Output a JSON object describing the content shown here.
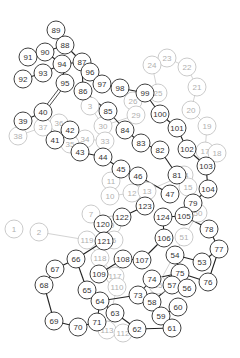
{
  "diagram": {
    "type": "node-chain-graph",
    "node_radius": 9,
    "colors": {
      "dark_stroke": "#2a2a2a",
      "faint_stroke": "#bdbdbd",
      "dark_text": "#333333",
      "faint_text": "#b0b0b0",
      "background": "#ffffff"
    },
    "dark_nodes": [
      {
        "id": "89",
        "x": 56,
        "y": 30
      },
      {
        "id": "88",
        "x": 65,
        "y": 45
      },
      {
        "id": "90",
        "x": 45,
        "y": 52
      },
      {
        "id": "91",
        "x": 28,
        "y": 57
      },
      {
        "id": "87",
        "x": 82,
        "y": 62
      },
      {
        "id": "94",
        "x": 62,
        "y": 64
      },
      {
        "id": "93",
        "x": 43,
        "y": 73
      },
      {
        "id": "96",
        "x": 90,
        "y": 72
      },
      {
        "id": "92",
        "x": 23,
        "y": 79
      },
      {
        "id": "97",
        "x": 102,
        "y": 84
      },
      {
        "id": "95",
        "x": 65,
        "y": 83
      },
      {
        "id": "98",
        "x": 120,
        "y": 88
      },
      {
        "id": "86",
        "x": 83,
        "y": 91
      },
      {
        "id": "99",
        "x": 145,
        "y": 93
      },
      {
        "id": "40",
        "x": 43,
        "y": 112
      },
      {
        "id": "85",
        "x": 108,
        "y": 111
      },
      {
        "id": "100",
        "x": 160,
        "y": 114
      },
      {
        "id": "39",
        "x": 23,
        "y": 121
      },
      {
        "id": "42",
        "x": 70,
        "y": 130
      },
      {
        "id": "84",
        "x": 125,
        "y": 130
      },
      {
        "id": "101",
        "x": 177,
        "y": 128
      },
      {
        "id": "41",
        "x": 55,
        "y": 140
      },
      {
        "id": "83",
        "x": 141,
        "y": 143
      },
      {
        "id": "43",
        "x": 80,
        "y": 152
      },
      {
        "id": "102",
        "x": 187,
        "y": 149
      },
      {
        "id": "82",
        "x": 160,
        "y": 150
      },
      {
        "id": "44",
        "x": 103,
        "y": 157
      },
      {
        "id": "103",
        "x": 206,
        "y": 166
      },
      {
        "id": "45",
        "x": 121,
        "y": 169
      },
      {
        "id": "46",
        "x": 138,
        "y": 176
      },
      {
        "id": "81",
        "x": 177,
        "y": 175
      },
      {
        "id": "104",
        "x": 208,
        "y": 189
      },
      {
        "id": "47",
        "x": 170,
        "y": 194
      },
      {
        "id": "79",
        "x": 193,
        "y": 203
      },
      {
        "id": "123",
        "x": 145,
        "y": 206
      },
      {
        "id": "122",
        "x": 122,
        "y": 217
      },
      {
        "id": "124",
        "x": 163,
        "y": 217
      },
      {
        "id": "105",
        "x": 184,
        "y": 216
      },
      {
        "id": "78",
        "x": 209,
        "y": 229
      },
      {
        "id": "120",
        "x": 103,
        "y": 224
      },
      {
        "id": "106",
        "x": 164,
        "y": 238
      },
      {
        "id": "121",
        "x": 104,
        "y": 241
      },
      {
        "id": "77",
        "x": 219,
        "y": 249
      },
      {
        "id": "66",
        "x": 76,
        "y": 259
      },
      {
        "id": "108",
        "x": 123,
        "y": 259
      },
      {
        "id": "107",
        "x": 142,
        "y": 260
      },
      {
        "id": "54",
        "x": 175,
        "y": 255
      },
      {
        "id": "53",
        "x": 202,
        "y": 262
      },
      {
        "id": "67",
        "x": 55,
        "y": 269
      },
      {
        "id": "109",
        "x": 99,
        "y": 274
      },
      {
        "id": "75",
        "x": 180,
        "y": 273
      },
      {
        "id": "74",
        "x": 152,
        "y": 279
      },
      {
        "id": "76",
        "x": 208,
        "y": 282
      },
      {
        "id": "68",
        "x": 44,
        "y": 285
      },
      {
        "id": "57",
        "x": 172,
        "y": 285
      },
      {
        "id": "56",
        "x": 187,
        "y": 288
      },
      {
        "id": "65",
        "x": 87,
        "y": 290
      },
      {
        "id": "73",
        "x": 138,
        "y": 295
      },
      {
        "id": "58",
        "x": 152,
        "y": 302
      },
      {
        "id": "64",
        "x": 100,
        "y": 301
      },
      {
        "id": "60",
        "x": 178,
        "y": 307
      },
      {
        "id": "63",
        "x": 115,
        "y": 313
      },
      {
        "id": "59",
        "x": 161,
        "y": 316
      },
      {
        "id": "69",
        "x": 54,
        "y": 321
      },
      {
        "id": "71",
        "x": 97,
        "y": 322
      },
      {
        "id": "62",
        "x": 137,
        "y": 329
      },
      {
        "id": "61",
        "x": 172,
        "y": 328
      },
      {
        "id": "70",
        "x": 78,
        "y": 327
      }
    ],
    "faint_nodes": [
      {
        "id": "23",
        "x": 167,
        "y": 58
      },
      {
        "id": "24",
        "x": 152,
        "y": 65
      },
      {
        "id": "22",
        "x": 187,
        "y": 67
      },
      {
        "id": "21",
        "x": 197,
        "y": 87
      },
      {
        "id": "25",
        "x": 158,
        "y": 93
      },
      {
        "id": "26",
        "x": 133,
        "y": 101
      },
      {
        "id": "20",
        "x": 191,
        "y": 110
      },
      {
        "id": "29",
        "x": 136,
        "y": 115
      },
      {
        "id": "3",
        "x": 90,
        "y": 106
      },
      {
        "id": "30",
        "x": 103,
        "y": 126
      },
      {
        "id": "19",
        "x": 207,
        "y": 126
      },
      {
        "id": "36",
        "x": 59,
        "y": 123
      },
      {
        "id": "37",
        "x": 43,
        "y": 127
      },
      {
        "id": "38",
        "x": 18,
        "y": 136
      },
      {
        "id": "34",
        "x": 85,
        "y": 139
      },
      {
        "id": "33",
        "x": 105,
        "y": 141
      },
      {
        "id": "35",
        "x": 70,
        "y": 144
      },
      {
        "id": "17",
        "x": 205,
        "y": 151
      },
      {
        "id": "18",
        "x": 217,
        "y": 153
      },
      {
        "id": "11",
        "x": 111,
        "y": 181
      },
      {
        "id": "10",
        "x": 110,
        "y": 196
      },
      {
        "id": "12",
        "x": 132,
        "y": 193
      },
      {
        "id": "13",
        "x": 147,
        "y": 191
      },
      {
        "id": "14",
        "x": 184,
        "y": 175
      },
      {
        "id": "15",
        "x": 188,
        "y": 187
      },
      {
        "id": "7",
        "x": 91,
        "y": 214
      },
      {
        "id": "9",
        "x": 112,
        "y": 225
      },
      {
        "id": "1",
        "x": 14,
        "y": 229
      },
      {
        "id": "2",
        "x": 39,
        "y": 232
      },
      {
        "id": "119",
        "x": 87,
        "y": 240
      },
      {
        "id": "5",
        "x": 114,
        "y": 240
      },
      {
        "id": "118",
        "x": 100,
        "y": 258
      },
      {
        "id": "50",
        "x": 198,
        "y": 213
      },
      {
        "id": "51",
        "x": 184,
        "y": 237
      },
      {
        "id": "117",
        "x": 115,
        "y": 276
      },
      {
        "id": "110",
        "x": 117,
        "y": 287
      },
      {
        "id": "113",
        "x": 107,
        "y": 330
      },
      {
        "id": "112",
        "x": 123,
        "y": 333
      },
      {
        "id": "55",
        "x": 158,
        "y": 285
      }
    ],
    "dark_edges": [
      [
        "89",
        "88"
      ],
      [
        "88",
        "90"
      ],
      [
        "88",
        "87"
      ],
      [
        "90",
        "91"
      ],
      [
        "90",
        "94"
      ],
      [
        "94",
        "87"
      ],
      [
        "94",
        "93"
      ],
      [
        "93",
        "92"
      ],
      [
        "94",
        "95"
      ],
      [
        "87",
        "96"
      ],
      [
        "87",
        "86"
      ],
      [
        "96",
        "97"
      ],
      [
        "97",
        "98"
      ],
      [
        "98",
        "99"
      ],
      [
        "99",
        "100"
      ],
      [
        "100",
        "101"
      ],
      [
        "101",
        "102"
      ],
      [
        "102",
        "103"
      ],
      [
        "103",
        "104"
      ],
      [
        "104",
        "79"
      ],
      [
        "79",
        "81"
      ],
      [
        "81",
        "82"
      ],
      [
        "82",
        "83"
      ],
      [
        "83",
        "84"
      ],
      [
        "84",
        "85"
      ],
      [
        "85",
        "86"
      ],
      [
        "40",
        "39"
      ],
      [
        "40",
        "41"
      ],
      [
        "41",
        "42"
      ],
      [
        "42",
        "43"
      ],
      [
        "43",
        "44"
      ],
      [
        "44",
        "45"
      ],
      [
        "45",
        "46"
      ],
      [
        "46",
        "47"
      ],
      [
        "79",
        "105"
      ],
      [
        "105",
        "124"
      ],
      [
        "105",
        "78"
      ],
      [
        "78",
        "77"
      ],
      [
        "77",
        "76"
      ],
      [
        "76",
        "75"
      ],
      [
        "75",
        "54"
      ],
      [
        "54",
        "53"
      ],
      [
        "53",
        "77"
      ],
      [
        "106",
        "107"
      ],
      [
        "107",
        "108"
      ],
      [
        "106",
        "124"
      ],
      [
        "123",
        "122"
      ],
      [
        "122",
        "120"
      ],
      [
        "120",
        "121"
      ],
      [
        "121",
        "66"
      ],
      [
        "66",
        "67"
      ],
      [
        "67",
        "68"
      ],
      [
        "68",
        "69"
      ],
      [
        "69",
        "70"
      ],
      [
        "70",
        "71"
      ],
      [
        "71",
        "64"
      ],
      [
        "64",
        "65"
      ],
      [
        "65",
        "66"
      ],
      [
        "64",
        "73"
      ],
      [
        "64",
        "63"
      ],
      [
        "63",
        "62"
      ],
      [
        "62",
        "61"
      ],
      [
        "61",
        "59"
      ],
      [
        "59",
        "60"
      ],
      [
        "59",
        "58"
      ],
      [
        "58",
        "73"
      ],
      [
        "73",
        "74"
      ],
      [
        "74",
        "75"
      ],
      [
        "75",
        "57"
      ],
      [
        "57",
        "56"
      ],
      [
        "58",
        "57"
      ],
      [
        "109",
        "108"
      ]
    ],
    "double_edges": [
      [
        "95",
        "40"
      ]
    ],
    "faint_edges": [
      [
        "23",
        "24"
      ],
      [
        "23",
        "22"
      ],
      [
        "22",
        "21"
      ],
      [
        "21",
        "20"
      ],
      [
        "20",
        "19"
      ],
      [
        "19",
        "17"
      ],
      [
        "17",
        "18"
      ],
      [
        "24",
        "25"
      ],
      [
        "25",
        "26"
      ],
      [
        "26",
        "29"
      ],
      [
        "29",
        "30"
      ],
      [
        "30",
        "3"
      ],
      [
        "30",
        "33"
      ],
      [
        "33",
        "34"
      ],
      [
        "34",
        "35"
      ],
      [
        "35",
        "36"
      ],
      [
        "36",
        "37"
      ],
      [
        "37",
        "38"
      ],
      [
        "11",
        "10"
      ],
      [
        "10",
        "12"
      ],
      [
        "12",
        "13"
      ],
      [
        "13",
        "14"
      ],
      [
        "14",
        "15"
      ],
      [
        "11",
        "45"
      ],
      [
        "7",
        "9"
      ],
      [
        "9",
        "5"
      ],
      [
        "2",
        "119"
      ],
      [
        "119",
        "118"
      ],
      [
        "118",
        "117"
      ],
      [
        "117",
        "110"
      ],
      [
        "110",
        "113"
      ],
      [
        "113",
        "112"
      ],
      [
        "50",
        "51"
      ],
      [
        "51",
        "55"
      ],
      [
        "55",
        "57"
      ],
      [
        "12",
        "123"
      ],
      [
        "15",
        "47"
      ]
    ]
  }
}
